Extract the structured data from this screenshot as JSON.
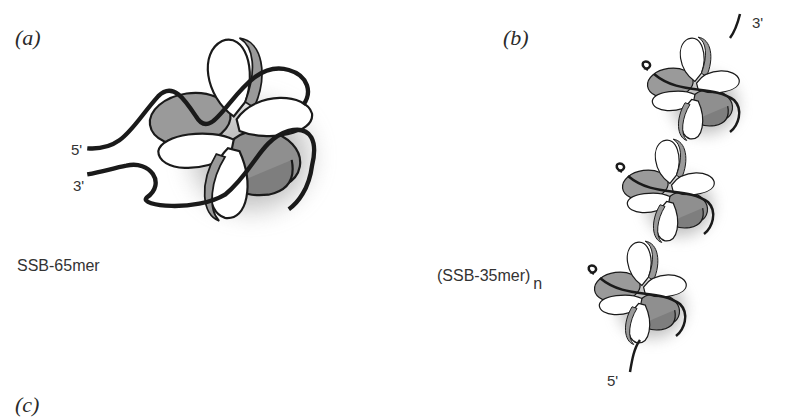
{
  "figure": {
    "panels": [
      {
        "id": "a",
        "label": "(a)",
        "caption": "SSB-65mer",
        "ends": {
          "five_prime": "5'",
          "three_prime": "3'"
        }
      },
      {
        "id": "b",
        "label": "(b)",
        "caption": "(SSB-35mer)",
        "caption_subscript": "n",
        "ends": {
          "five_prime": "5'",
          "three_prime": "3'"
        }
      },
      {
        "id": "c",
        "label": "(c)"
      }
    ],
    "colors": {
      "subunit_white": "#ffffff",
      "subunit_gray": "#9a9a9a",
      "subunit_gray_dark": "#7e7e7e",
      "dna_strand": "#1a1a1a",
      "shadow": "#8c8c8c"
    }
  }
}
